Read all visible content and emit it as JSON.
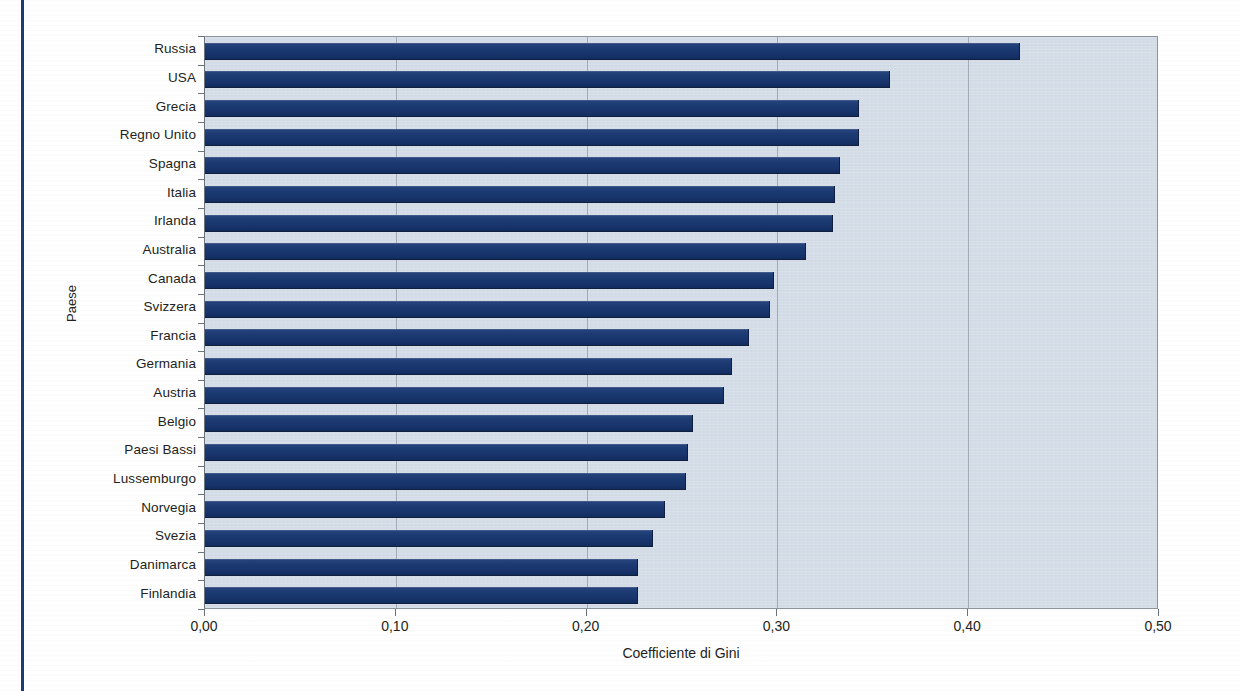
{
  "page": {
    "margin_rule_color": "#1d3a74",
    "background_color": "#fefefe"
  },
  "chart_data": {
    "type": "bar",
    "orientation": "horizontal",
    "title": "",
    "xlabel": "Coefficiente di Gini",
    "ylabel": "Paese",
    "xlim": [
      0,
      0.5
    ],
    "xticks": [
      0,
      0.1,
      0.2,
      0.3,
      0.4,
      0.5
    ],
    "xtick_labels": [
      "0,00",
      "0,10",
      "0,20",
      "0,30",
      "0,40",
      "0,50"
    ],
    "grid": "vertical",
    "legend": "none",
    "bar_color": "#1c3a72",
    "plot_background_color": "#d3dce6",
    "categories": [
      "Russia",
      "USA",
      "Grecia",
      "Regno Unito",
      "Spagna",
      "Italia",
      "Irlanda",
      "Australia",
      "Canada",
      "Svizzera",
      "Francia",
      "Germania",
      "Austria",
      "Belgio",
      "Paesi Bassi",
      "Lussemburgo",
      "Norvegia",
      "Svezia",
      "Danimarca",
      "Finlandia"
    ],
    "values": [
      0.427,
      0.359,
      0.343,
      0.343,
      0.333,
      0.33,
      0.329,
      0.315,
      0.298,
      0.296,
      0.285,
      0.276,
      0.272,
      0.256,
      0.253,
      0.252,
      0.241,
      0.235,
      0.227,
      0.227
    ]
  }
}
